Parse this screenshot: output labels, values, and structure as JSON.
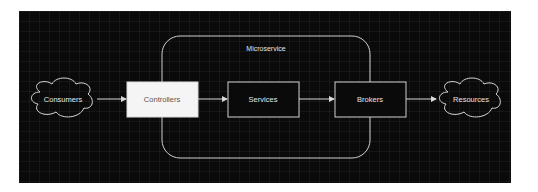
{
  "diagram": {
    "container": {
      "label": "Microservice"
    },
    "nodes": [
      {
        "id": "consumers",
        "label": "Consumers",
        "shape": "cloud"
      },
      {
        "id": "controllers",
        "label": "Controllers",
        "shape": "box",
        "fill": "#f5f5f5"
      },
      {
        "id": "services",
        "label": "Services",
        "shape": "box"
      },
      {
        "id": "brokers",
        "label": "Brokers",
        "shape": "box"
      },
      {
        "id": "resources",
        "label": "Resources",
        "shape": "cloud"
      }
    ],
    "edges": [
      {
        "from": "consumers",
        "to": "controllers"
      },
      {
        "from": "controllers",
        "to": "services"
      },
      {
        "from": "services",
        "to": "brokers"
      },
      {
        "from": "brokers",
        "to": "resources"
      }
    ],
    "colors": {
      "background": "#0a0a0a",
      "stroke": "#d9d9d9",
      "highlight_fill": "#f5f5f5"
    }
  }
}
